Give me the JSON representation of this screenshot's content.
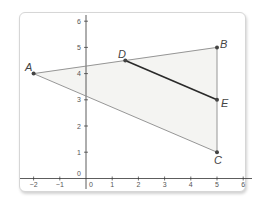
{
  "diagram": {
    "type": "coordinate-geometry",
    "axes": {
      "x_ticks": [
        "−2",
        "−1",
        "0",
        "1",
        "2",
        "3",
        "4",
        "5",
        "6"
      ],
      "y_ticks": [
        "0",
        "1",
        "2",
        "3",
        "4",
        "5",
        "6"
      ],
      "x_range": [
        -2.5,
        6.3
      ],
      "y_range": [
        -0.4,
        6.4
      ]
    },
    "points": {
      "A": {
        "label": "A",
        "x": -2,
        "y": 4
      },
      "B": {
        "label": "B",
        "x": 5,
        "y": 5
      },
      "C": {
        "label": "C",
        "x": 5,
        "y": 1
      },
      "D": {
        "label": "D",
        "x": 1.5,
        "y": 4.5
      },
      "E": {
        "label": "E",
        "x": 5,
        "y": 3
      }
    },
    "segments": [
      {
        "from": "A",
        "to": "B",
        "style": "thin-gray"
      },
      {
        "from": "B",
        "to": "C",
        "style": "thin-gray"
      },
      {
        "from": "C",
        "to": "A",
        "style": "thin-gray"
      },
      {
        "from": "D",
        "to": "E",
        "style": "bold-dark"
      }
    ],
    "fill": {
      "polygon": [
        "A",
        "B",
        "C"
      ],
      "color": "#f4f4f2"
    },
    "colors": {
      "triangle_edge": "#8a8a8a",
      "midsegment": "#2a2a2a",
      "point": "#444444",
      "axis": "#333333",
      "frame_border": "#d6d6d6"
    }
  }
}
